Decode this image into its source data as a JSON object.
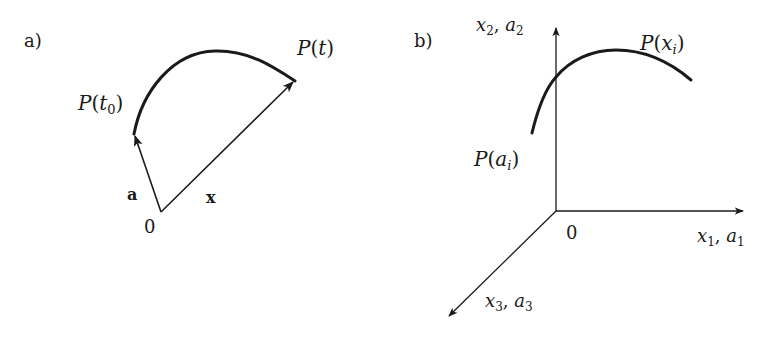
{
  "panels": {
    "a": {
      "tag": "a)",
      "origin_label": "0",
      "vector_a_label": "a",
      "vector_x_label": "x",
      "start_point": {
        "P": "P(",
        "arg": "t",
        "sub": "0",
        "close": ")"
      },
      "end_point": {
        "P": "P(",
        "arg": "t",
        "close": ")"
      }
    },
    "b": {
      "tag": "b)",
      "origin_label": "0",
      "axis_x1": {
        "v1": "x",
        "s1": "1",
        "sep": ", ",
        "v2": "a",
        "s2": "1"
      },
      "axis_x2": {
        "v1": "x",
        "s1": "2",
        "sep": ", ",
        "v2": "a",
        "s2": "2"
      },
      "axis_x3": {
        "v1": "x",
        "s1": "3",
        "sep": ", ",
        "v2": "a",
        "s2": "3"
      },
      "start_point": {
        "P": "P(",
        "arg": "a",
        "sub": "i",
        "close": ")"
      },
      "end_point": {
        "P": "P(",
        "arg": "x",
        "sub": "i",
        "close": ")"
      }
    }
  },
  "colors": {
    "ink": "#1a1a1a",
    "background": "#ffffff"
  }
}
